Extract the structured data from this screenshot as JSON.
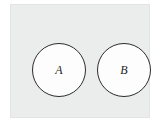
{
  "figure": {
    "type": "venn-diagram",
    "universe": {
      "name": "universal-set-rectangle",
      "label": "",
      "fill_color": "#ebecec",
      "border_color": "#e2e3e3"
    },
    "sets": [
      {
        "id": "set-a",
        "label": "A",
        "fill_color": "#fdfdfd",
        "outline_color": "#2b2b2b",
        "center_x": 48,
        "center_y": 65,
        "radius": 27
      },
      {
        "id": "set-b",
        "label": "B",
        "fill_color": "#fdfdfd",
        "outline_color": "#2b2b2b",
        "center_x": 113,
        "center_y": 65,
        "radius": 27
      }
    ],
    "background_color": "#ffffff"
  }
}
